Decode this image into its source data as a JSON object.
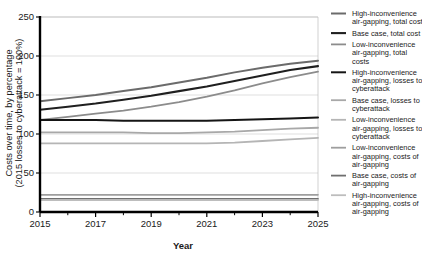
{
  "chart_data": {
    "type": "line",
    "title": "",
    "xlabel": "Year",
    "ylabel": "Costs over time, by percentage (2015 losses to cyberattack = 100%)",
    "ylabel_line1": "Costs over time, by percentage",
    "ylabel_line2": "(2015 losses to cyberattack = 100%)",
    "x": [
      2015,
      2016,
      2017,
      2018,
      2019,
      2020,
      2021,
      2022,
      2023,
      2024,
      2025
    ],
    "xlim": [
      2015,
      2025
    ],
    "ylim": [
      0,
      250
    ],
    "xticks": [
      2015,
      2017,
      2019,
      2021,
      2023,
      2025
    ],
    "xtick_labels": [
      "2015",
      "2017",
      "2019",
      "2021",
      "2023",
      "2025"
    ],
    "xminor_ticks": [
      2016,
      2018,
      2020,
      2022,
      2024
    ],
    "yticks": [
      0,
      50,
      100,
      150,
      200,
      250
    ],
    "ytick_labels": [
      "0",
      "50",
      "100",
      "150",
      "200",
      "250"
    ],
    "grid": "horizontal",
    "legend_position": "right",
    "series": [
      {
        "name": "High-inconvenience air-gapping, total cost",
        "label_lines": [
          "High-inconvenience",
          "air-gapping, total cost"
        ],
        "color": "#6b6b6b",
        "width": 2.0,
        "values": [
          142,
          146,
          150,
          155,
          160,
          166,
          172,
          179,
          185,
          190,
          194
        ]
      },
      {
        "name": "Base case, total cost",
        "label_lines": [
          "Base case, total cost"
        ],
        "color": "#1f1f1f",
        "width": 2.1,
        "values": [
          131,
          135,
          139,
          144,
          149,
          155,
          161,
          168,
          175,
          182,
          187
        ]
      },
      {
        "name": "Low-inconvenience air-gapping, total costs",
        "label_lines": [
          "Low-inconvenience",
          "air-gapping, total",
          "costs"
        ],
        "color": "#8c8c8c",
        "width": 1.8,
        "values": [
          118,
          122,
          126,
          130,
          135,
          141,
          148,
          156,
          165,
          173,
          180
        ]
      },
      {
        "name": "High-inconvenience air-gapping, losses to cyberattack",
        "label_lines": [
          "High-inconvenience",
          "air-gapping, losses to",
          "cyberattack"
        ],
        "color": "#151515",
        "width": 2.0,
        "values": [
          118,
          118,
          118,
          117,
          117,
          117,
          117,
          118,
          119,
          120,
          121
        ]
      },
      {
        "name": "Base case, losses to cyberattack",
        "label_lines": [
          "Base case, losses to",
          "cyberattack"
        ],
        "color": "#a8a8a8",
        "width": 1.8,
        "values": [
          102,
          102,
          102,
          102,
          101,
          101,
          102,
          103,
          105,
          107,
          108
        ]
      },
      {
        "name": "Low-inconvenience air-gapping, losses to cyberattack",
        "label_lines": [
          "Low-inconvenience",
          "air-gapping, losses to",
          "cyberattack"
        ],
        "color": "#b5b5b5",
        "width": 1.8,
        "values": [
          88,
          88,
          88,
          88,
          88,
          88,
          88,
          89,
          91,
          93,
          95
        ]
      },
      {
        "name": "Low-inconvenience air-gapping, costs of air-gapping",
        "label_lines": [
          "Low-inconvenience",
          "air-gapping, costs of",
          "air-gapping"
        ],
        "color": "#9e9e9e",
        "width": 1.6,
        "values": [
          22,
          22,
          22,
          22,
          22,
          22,
          22,
          22,
          22,
          22,
          22
        ]
      },
      {
        "name": "Base case, costs of air-gapping",
        "label_lines": [
          "Base case, costs of",
          "air-gapping"
        ],
        "color": "#6f6f6f",
        "width": 1.7,
        "values": [
          17,
          17,
          17,
          17,
          17,
          17,
          17,
          17,
          17,
          17,
          17
        ]
      },
      {
        "name": "High-inconvenience air-gapping, costs of air-gapping",
        "label_lines": [
          "High-inconvenience",
          "air-gapping, costs of",
          "air-gapping"
        ],
        "color": "#bdbdbd",
        "width": 1.6,
        "values": [
          15,
          15,
          15,
          15,
          15,
          15,
          15,
          15,
          15,
          15,
          15
        ]
      }
    ]
  }
}
